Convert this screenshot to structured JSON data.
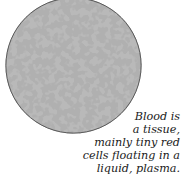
{
  "figure": {
    "colors": {
      "plasma": "#b9b9b9",
      "cells": "#6e6e6e",
      "rim": "#5a5a5a"
    }
  },
  "caption": {
    "lines": [
      "Blood is",
      "a tissue,",
      "mainly tiny red",
      "cells floating in a",
      "liquid, plasma."
    ]
  }
}
